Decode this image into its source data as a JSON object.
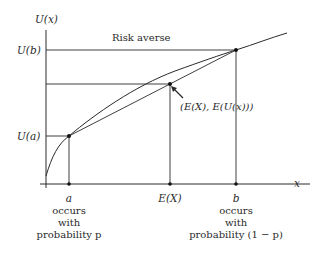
{
  "title": "Risk averse",
  "axes": {
    "y_label": "U(x)",
    "x_label": "x"
  },
  "y_ticks": {
    "u_b": "U(b)",
    "u_a": "U(a)"
  },
  "annotation": "(E(X), E(U(x)))",
  "x_points": {
    "a": {
      "label": "a",
      "desc_lines": [
        "occurs",
        "with",
        "probability p"
      ]
    },
    "ex": {
      "label": "E(X)"
    },
    "b": {
      "label": "b",
      "desc_lines": [
        "occurs",
        "with",
        "probability (1 − p)"
      ]
    }
  },
  "colors": {
    "line": "#2a2a2a",
    "background": "#ffffff"
  }
}
